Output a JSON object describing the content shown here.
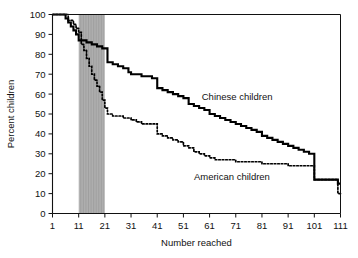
{
  "chart_data": {
    "type": "line",
    "title": "",
    "xlabel": "Number reached",
    "ylabel": "Percent children",
    "xlim": [
      1,
      111
    ],
    "ylim": [
      0,
      100
    ],
    "grid": false,
    "legend_position": "inline-annotation",
    "xticks": [
      1,
      11,
      21,
      31,
      41,
      51,
      61,
      71,
      81,
      91,
      101,
      111
    ],
    "xtick_labels": [
      "1",
      "11",
      "21",
      "31",
      "41",
      "51",
      "61",
      "71",
      "81",
      "91",
      "101",
      "111"
    ],
    "yticks": [
      0,
      10,
      20,
      30,
      40,
      50,
      60,
      70,
      80,
      90,
      100
    ],
    "ytick_labels": [
      "0",
      "10",
      "20",
      "30",
      "40",
      "50",
      "60",
      "70",
      "80",
      "90",
      "100"
    ],
    "annotations": [
      {
        "text": "Chinese children",
        "x": 58,
        "y": 57
      },
      {
        "text": "American children",
        "x": 55,
        "y": 17
      }
    ],
    "shaded_band": {
      "x_start": 11,
      "x_end": 21,
      "color": "#b8b8b8",
      "label": ""
    },
    "series": [
      {
        "name": "Chinese children",
        "style": "solid",
        "color": "#000000",
        "step": "post",
        "x": [
          1,
          5,
          6,
          7,
          8,
          9,
          10,
          11,
          12,
          14,
          16,
          18,
          20,
          21,
          22,
          24,
          26,
          28,
          30,
          31,
          33,
          35,
          37,
          39,
          40,
          41,
          43,
          45,
          47,
          49,
          51,
          53,
          55,
          57,
          59,
          61,
          63,
          65,
          67,
          69,
          71,
          73,
          75,
          77,
          79,
          81,
          83,
          85,
          87,
          89,
          91,
          93,
          95,
          97,
          99,
          100,
          101,
          103,
          105,
          107,
          109,
          110,
          111
        ],
        "y": [
          100,
          100,
          98,
          96,
          94,
          92,
          90,
          87,
          87,
          86,
          85,
          84,
          83,
          83,
          76,
          75,
          74,
          73,
          71,
          70,
          70,
          69,
          69,
          68,
          68,
          63,
          62,
          61,
          60,
          59,
          58,
          55,
          54,
          53,
          52,
          50,
          49,
          48,
          47,
          46,
          45,
          44,
          43,
          42,
          41,
          39,
          38,
          37,
          36,
          35,
          34,
          33,
          32,
          31,
          30,
          30,
          17,
          17,
          17,
          17,
          17,
          15,
          15
        ]
      },
      {
        "name": "American children",
        "style": "dotted",
        "color": "#000000",
        "step": "post",
        "x": [
          1,
          5,
          7,
          9,
          10,
          11,
          12,
          13,
          14,
          15,
          16,
          17,
          18,
          19,
          20,
          21,
          22,
          24,
          26,
          28,
          30,
          31,
          33,
          35,
          37,
          39,
          40,
          41,
          43,
          45,
          47,
          49,
          51,
          53,
          55,
          57,
          59,
          61,
          63,
          65,
          67,
          69,
          71,
          73,
          75,
          77,
          79,
          81,
          83,
          85,
          87,
          89,
          91,
          93,
          95,
          97,
          99,
          100,
          101,
          103,
          105,
          107,
          109,
          110,
          111
        ],
        "y": [
          100,
          100,
          97,
          95,
          93,
          91,
          85,
          82,
          78,
          74,
          70,
          67,
          64,
          61,
          57,
          53,
          50,
          49,
          49,
          48,
          48,
          47,
          46,
          45,
          45,
          45,
          45,
          40,
          39,
          38,
          37,
          36,
          34,
          33,
          31,
          30,
          29,
          28,
          27,
          27,
          27,
          27,
          26,
          26,
          26,
          26,
          26,
          25,
          25,
          25,
          25,
          25,
          24,
          24,
          24,
          24,
          24,
          24,
          17,
          17,
          17,
          17,
          17,
          10,
          10
        ]
      }
    ]
  }
}
